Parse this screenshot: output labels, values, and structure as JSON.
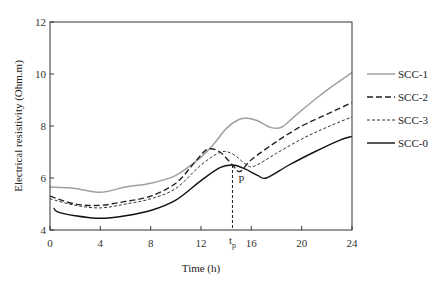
{
  "chart_data": {
    "type": "line",
    "title": "",
    "xlabel": "Time (h)",
    "ylabel": "Electrical resistivity (Ohm.m)",
    "xlim": [
      0,
      24
    ],
    "ylim": [
      4,
      12
    ],
    "xticks": [
      "0",
      "4",
      "8",
      "12",
      "16",
      "20",
      "24"
    ],
    "yticks": [
      "4",
      "6",
      "8",
      "10",
      "12"
    ],
    "grid": false,
    "legend_position": "right",
    "annotations": [
      {
        "text": "P",
        "x": 14.8,
        "y": 6.4
      },
      {
        "text": "tp",
        "x": 14.5,
        "note": "vertical dashed line from P down to x-axis"
      }
    ],
    "series": [
      {
        "name": "SCC-1",
        "style": "solid-gray",
        "color": "#a0a0a0",
        "x": [
          0,
          2,
          4,
          6,
          8,
          10,
          12,
          13,
          14,
          15,
          15.7,
          16.5,
          17.5,
          18.4,
          19.5,
          21,
          22.5,
          24
        ],
        "y": [
          5.65,
          5.6,
          5.45,
          5.65,
          5.8,
          6.1,
          6.8,
          7.3,
          7.9,
          8.25,
          8.3,
          8.2,
          7.95,
          7.95,
          8.4,
          9.0,
          9.55,
          10.05
        ]
      },
      {
        "name": "SCC-2",
        "style": "long-dash-black",
        "color": "#222222",
        "x": [
          0,
          2,
          4,
          6,
          8,
          10,
          11.5,
          12.5,
          13.5,
          14.5,
          15.1,
          16,
          18,
          20,
          22,
          24
        ],
        "y": [
          5.3,
          5.0,
          4.95,
          5.1,
          5.3,
          5.8,
          6.6,
          7.1,
          7.0,
          6.5,
          6.25,
          6.7,
          7.4,
          8.0,
          8.45,
          8.9
        ]
      },
      {
        "name": "SCC-3",
        "style": "short-dash-black",
        "color": "#333333",
        "x": [
          0,
          2,
          4,
          6,
          8,
          10,
          12,
          13.6,
          14.6,
          15.5,
          16.2,
          18,
          20,
          22,
          24
        ],
        "y": [
          5.2,
          4.95,
          4.85,
          5.0,
          5.2,
          5.6,
          6.5,
          7.0,
          6.9,
          6.55,
          6.45,
          6.95,
          7.5,
          7.95,
          8.35
        ]
      },
      {
        "name": "SCC-0",
        "style": "solid-black",
        "color": "#111111",
        "x": [
          0.3,
          0.6,
          2,
          4,
          6,
          8,
          10,
          12,
          13.5,
          14.5,
          15.5,
          16.5,
          17.2,
          19,
          21,
          23,
          24
        ],
        "y": [
          4.85,
          4.7,
          4.55,
          4.45,
          4.55,
          4.75,
          5.15,
          5.9,
          6.4,
          6.5,
          6.35,
          6.1,
          6.0,
          6.5,
          7.0,
          7.45,
          7.6
        ]
      }
    ]
  }
}
